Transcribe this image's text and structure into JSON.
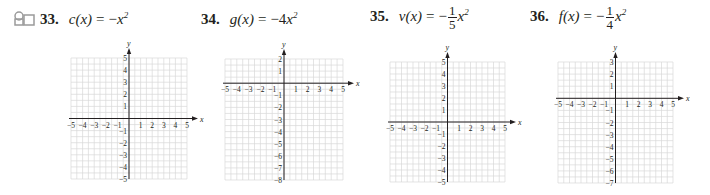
{
  "problems": [
    {
      "number": "33.",
      "fname": "c",
      "var": "x",
      "rhs_prefix": "−",
      "frac": null,
      "rhs_base": "x",
      "exponent": "2",
      "has_icon": true,
      "icon": "video-tutorial-icon",
      "grid": {
        "xmin": -5,
        "xmax": 5,
        "ymin": -5,
        "ymax": 5,
        "x_label": "x",
        "y_label": "y"
      }
    },
    {
      "number": "34.",
      "fname": "g",
      "var": "x",
      "rhs_prefix": "−4",
      "frac": null,
      "rhs_base": "x",
      "exponent": "2",
      "has_icon": false,
      "grid": {
        "xmin": -5,
        "xmax": 5,
        "ymin": -8,
        "ymax": 2,
        "x_label": "x",
        "y_label": "y"
      }
    },
    {
      "number": "35.",
      "fname": "v",
      "var": "x",
      "rhs_prefix": "−",
      "frac": {
        "num": "1",
        "den": "5"
      },
      "rhs_base": "x",
      "exponent": "2",
      "has_icon": false,
      "grid": {
        "xmin": -5,
        "xmax": 5,
        "ymin": -5,
        "ymax": 5,
        "x_label": "x",
        "y_label": "y"
      }
    },
    {
      "number": "36.",
      "fname": "f",
      "var": "x",
      "rhs_prefix": "−",
      "frac": {
        "num": "1",
        "den": "4"
      },
      "rhs_base": "x",
      "exponent": "2",
      "has_icon": false,
      "grid": {
        "xmin": -5,
        "xmax": 5,
        "ymin": -7,
        "ymax": 3,
        "x_label": "x",
        "y_label": "y"
      }
    }
  ],
  "colors": {
    "grid": "#d9d9d9",
    "axis": "#231f20",
    "text": "#231f20",
    "icon": "#9a9a9a"
  }
}
